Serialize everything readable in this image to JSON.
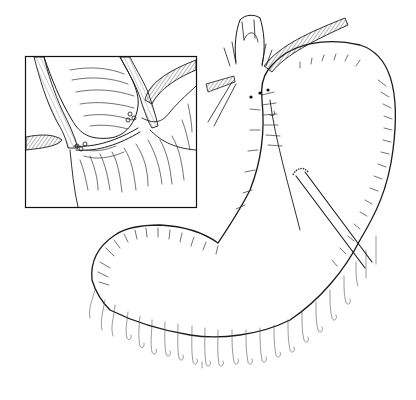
{
  "illustration": {
    "subject": "surgical anatomy line drawing of stomach with esophagus and inset detail",
    "background": "#ffffff",
    "ink_color": "#1a1a1a",
    "inset": {
      "x": 25,
      "y": 56,
      "width": 172,
      "height": 152
    }
  }
}
